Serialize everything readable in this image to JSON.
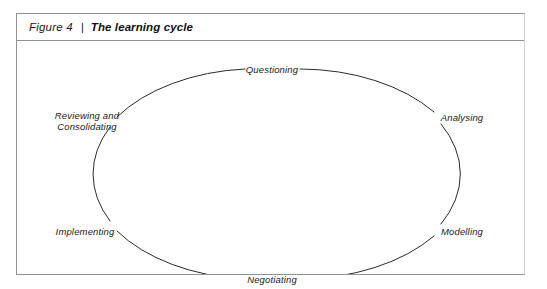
{
  "figure": {
    "label": "Figure 4",
    "separator": "|",
    "title": "The learning cycle"
  },
  "diagram": {
    "type": "cycle",
    "shape": "ellipse",
    "stroke_color": "#2b2b2b",
    "frame_color": "#8f9296",
    "background": "#ffffff",
    "nodes": [
      {
        "name": "questioning",
        "label": "Questioning",
        "position": "top",
        "angle_deg": 270
      },
      {
        "name": "analysing",
        "label": "Analysing",
        "position": "upper-right",
        "angle_deg": 325
      },
      {
        "name": "modelling",
        "label": "Modelling",
        "position": "lower-right",
        "angle_deg": 35
      },
      {
        "name": "negotiating",
        "label": "Negotiating",
        "position": "bottom",
        "angle_deg": 90
      },
      {
        "name": "implementing",
        "label": "Implementing",
        "position": "lower-left",
        "angle_deg": 145
      },
      {
        "name": "reviewing",
        "label": "Reviewing and Consolidating",
        "position": "upper-left",
        "angle_deg": 215,
        "line1": "Reviewing and",
        "line2": "Consolidating"
      }
    ]
  }
}
